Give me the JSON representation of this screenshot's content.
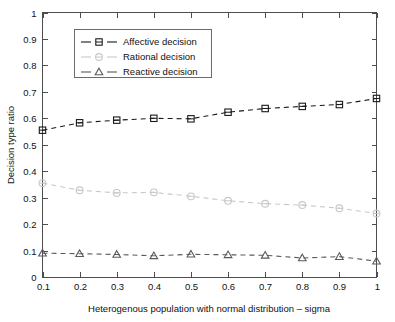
{
  "chart_data": {
    "type": "line",
    "title": "",
    "subtitle": "",
    "xlabel": "Heterogenous population with normal distribution – sigma",
    "ylabel": "Decision type ratio",
    "x": [
      0.1,
      0.2,
      0.3,
      0.4,
      0.5,
      0.6,
      0.7,
      0.8,
      0.9,
      1
    ],
    "xlim": [
      0.1,
      1
    ],
    "ylim": [
      0,
      1
    ],
    "xticks": [
      "0.1",
      "0.2",
      "0.3",
      "0.4",
      "0.5",
      "0.6",
      "0.7",
      "0.8",
      "0.9",
      "1"
    ],
    "yticks": [
      "0",
      "0.1",
      "0.2",
      "0.3",
      "0.4",
      "0.5",
      "0.6",
      "0.7",
      "0.8",
      "0.9",
      "1"
    ],
    "grid": false,
    "legend_position": "upper-left-inside",
    "series": [
      {
        "name": "Affective decision",
        "marker": "square",
        "linestyle": "dashed",
        "color": "#1a1a1a",
        "values": [
          0.555,
          0.583,
          0.593,
          0.6,
          0.598,
          0.623,
          0.637,
          0.645,
          0.652,
          0.675
        ]
      },
      {
        "name": "Rational decision",
        "marker": "circle",
        "linestyle": "dashed",
        "color": "#c8c8c8",
        "values": [
          0.355,
          0.328,
          0.318,
          0.32,
          0.305,
          0.288,
          0.277,
          0.272,
          0.26,
          0.24
        ]
      },
      {
        "name": "Reactive decision",
        "marker": "triangle",
        "linestyle": "dashed",
        "color": "#5a5a5a",
        "values": [
          0.09,
          0.088,
          0.085,
          0.08,
          0.086,
          0.084,
          0.082,
          0.072,
          0.077,
          0.06
        ]
      }
    ]
  },
  "legend": {
    "entries": [
      {
        "label": "Affective decision"
      },
      {
        "label": "Rational decision"
      },
      {
        "label": "Reactive decision"
      }
    ]
  },
  "axes": {
    "x_title": "Heterogenous population with normal distribution – sigma",
    "y_title": "Decision type ratio"
  }
}
